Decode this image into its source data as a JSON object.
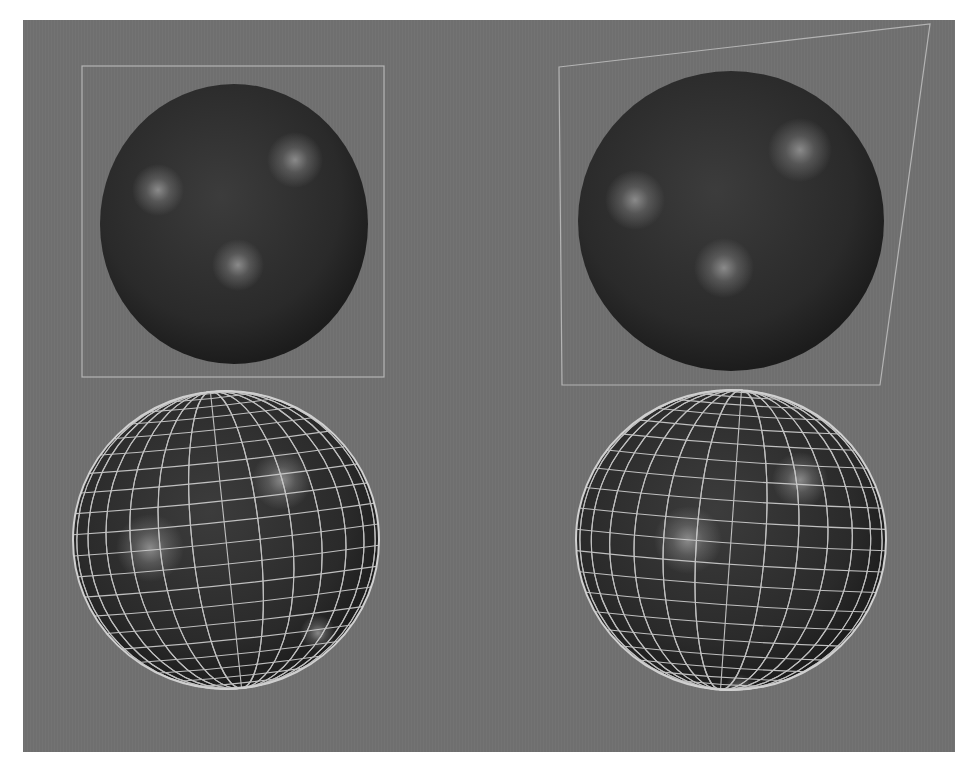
{
  "canvas": {
    "width": 959,
    "height": 765,
    "background": "#ffffff"
  },
  "panel": {
    "x": 23,
    "y": 20,
    "width": 932,
    "height": 732,
    "color": "#6f6f6f",
    "stripe": "#767676"
  },
  "frame_color": "#b4b4b4",
  "left_frame": {
    "x": 82,
    "y": 66,
    "width": 302,
    "height": 311
  },
  "right_frame": {
    "points": [
      [
        559,
        67
      ],
      [
        930,
        24
      ],
      [
        880,
        385
      ],
      [
        562,
        385
      ]
    ]
  },
  "spheres": [
    {
      "id": "shaded-left",
      "cx": 234,
      "cy": 224,
      "rx": 134,
      "ry": 140,
      "wire": false,
      "highlights": [
        [
          158,
          190,
          26
        ],
        [
          295,
          160,
          28
        ],
        [
          238,
          265,
          26
        ]
      ]
    },
    {
      "id": "shaded-right",
      "cx": 731,
      "cy": 221,
      "rx": 153,
      "ry": 150,
      "wire": false,
      "highlights": [
        [
          635,
          200,
          30
        ],
        [
          800,
          150,
          32
        ],
        [
          724,
          268,
          30
        ]
      ]
    },
    {
      "id": "wire-left",
      "cx": 226,
      "cy": 540,
      "rx": 153,
      "ry": 149,
      "wire": true,
      "tilt": -6,
      "highlights": [
        [
          150,
          548,
          34
        ],
        [
          282,
          480,
          30
        ],
        [
          318,
          633,
          18
        ]
      ]
    },
    {
      "id": "wire-right",
      "cx": 731,
      "cy": 540,
      "rx": 155,
      "ry": 150,
      "wire": true,
      "tilt": 4,
      "highlights": [
        [
          688,
          540,
          34
        ],
        [
          800,
          480,
          28
        ],
        [
          740,
          690,
          16
        ]
      ]
    }
  ],
  "sphere_colors": {
    "base": "#2a2a2a",
    "mid": "#3c3c3c",
    "edge": "#1c1c1c",
    "highlight": "#9a9a9a",
    "wire": "#d0d0d0"
  },
  "wire_grid": {
    "meridians": 28,
    "parallels": 22
  }
}
